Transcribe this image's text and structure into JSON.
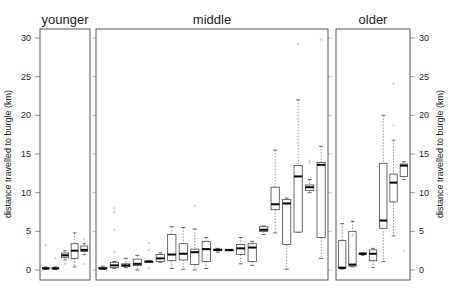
{
  "chart_data": {
    "type": "boxplot",
    "title": "",
    "ylabel": "distance travelled to burgle (km)",
    "ylim": [
      -1,
      31
    ],
    "yticks": [
      0,
      5,
      10,
      15,
      20,
      25,
      30
    ],
    "grid": false,
    "panels": [
      {
        "name": "younger",
        "boxes": [
          {
            "min": 0.1,
            "q1": 0.15,
            "median": 0.2,
            "q3": 0.3,
            "max": 0.4,
            "outliers": [
              3.2
            ]
          },
          {
            "min": 0.1,
            "q1": 0.15,
            "median": 0.2,
            "q3": 0.3,
            "max": 0.4,
            "outliers": [
              1.5
            ]
          },
          {
            "min": 1.3,
            "q1": 1.6,
            "median": 1.9,
            "q3": 2.2,
            "max": 2.5,
            "outliers": [
              0.8
            ]
          },
          {
            "min": 0.4,
            "q1": 1.5,
            "median": 2.5,
            "q3": 3.4,
            "max": 4.8,
            "outliers": []
          },
          {
            "min": 2.0,
            "q1": 2.4,
            "median": 2.6,
            "q3": 3.1,
            "max": 3.4,
            "outliers": [
              0.8,
              4.0
            ]
          }
        ]
      },
      {
        "name": "middle",
        "boxes": [
          {
            "min": 0.1,
            "q1": 0.15,
            "median": 0.2,
            "q3": 0.35,
            "max": 0.5,
            "outliers": []
          },
          {
            "min": 0.2,
            "q1": 0.3,
            "median": 0.6,
            "q3": 1.0,
            "max": 1.1,
            "outliers": [
              2.3,
              5.2,
              7.5,
              8.0
            ]
          },
          {
            "min": 0.3,
            "q1": 0.45,
            "median": 0.6,
            "q3": 0.8,
            "max": 1.5,
            "outliers": []
          },
          {
            "min": 0.0,
            "q1": 0.6,
            "median": 0.8,
            "q3": 1.4,
            "max": 1.9,
            "outliers": []
          },
          {
            "min": 1.0,
            "q1": 1.0,
            "median": 1.1,
            "q3": 1.1,
            "max": 1.2,
            "outliers": [
              0.2,
              2.6,
              3.5
            ]
          },
          {
            "min": 1.0,
            "q1": 1.1,
            "median": 1.5,
            "q3": 2.0,
            "max": 2.2,
            "outliers": []
          },
          {
            "min": 0.2,
            "q1": 1.2,
            "median": 2.0,
            "q3": 4.6,
            "max": 5.6,
            "outliers": []
          },
          {
            "min": 0.1,
            "q1": 1.3,
            "median": 2.1,
            "q3": 3.4,
            "max": 5.5,
            "outliers": []
          },
          {
            "min": 0.0,
            "q1": 0.7,
            "median": 2.3,
            "q3": 2.7,
            "max": 5.3,
            "outliers": [
              8.3
            ]
          },
          {
            "min": 0.2,
            "q1": 1.1,
            "median": 2.7,
            "q3": 3.7,
            "max": 4.2,
            "outliers": []
          },
          {
            "min": 2.3,
            "q1": 2.5,
            "median": 2.6,
            "q3": 2.7,
            "max": 2.8,
            "outliers": []
          },
          {
            "min": 2.6,
            "q1": 2.6,
            "median": 2.6,
            "q3": 2.6,
            "max": 2.6,
            "outliers": []
          },
          {
            "min": 0.8,
            "q1": 2.0,
            "median": 2.8,
            "q3": 3.3,
            "max": 4.2,
            "outliers": []
          },
          {
            "min": 0.6,
            "q1": 1.1,
            "median": 2.9,
            "q3": 3.4,
            "max": 3.7,
            "outliers": []
          },
          {
            "min": 4.6,
            "q1": 5.0,
            "median": 5.2,
            "q3": 5.6,
            "max": 5.7,
            "outliers": []
          },
          {
            "min": 4.8,
            "q1": 7.8,
            "median": 8.5,
            "q3": 10.7,
            "max": 15.5,
            "outliers": []
          },
          {
            "min": 0.1,
            "q1": 3.3,
            "median": 8.6,
            "q3": 9.1,
            "max": 9.3,
            "outliers": []
          },
          {
            "min": 4.9,
            "q1": 4.9,
            "median": 12.1,
            "q3": 13.5,
            "max": 22.0,
            "outliers": [
              29.2
            ]
          },
          {
            "min": 10.0,
            "q1": 10.3,
            "median": 10.7,
            "q3": 11.0,
            "max": 11.7,
            "outliers": [
              13.8,
              14.1
            ]
          },
          {
            "min": 1.5,
            "q1": 4.2,
            "median": 13.6,
            "q3": 13.9,
            "max": 16.0,
            "outliers": [
              29.8
            ]
          }
        ]
      },
      {
        "name": "older",
        "boxes": [
          {
            "min": 0.1,
            "q1": 0.2,
            "median": 0.3,
            "q3": 3.8,
            "max": 6.0,
            "outliers": []
          },
          {
            "min": 0.4,
            "q1": 0.5,
            "median": 0.7,
            "q3": 5.0,
            "max": 6.3,
            "outliers": [
              4.5
            ]
          },
          {
            "min": 1.9,
            "q1": 2.0,
            "median": 2.1,
            "q3": 2.2,
            "max": 2.2,
            "outliers": []
          },
          {
            "min": 0.3,
            "q1": 1.2,
            "median": 2.1,
            "q3": 2.6,
            "max": 2.8,
            "outliers": []
          },
          {
            "min": 1.1,
            "q1": 5.4,
            "median": 6.4,
            "q3": 13.8,
            "max": 20.0,
            "outliers": []
          },
          {
            "min": 4.4,
            "q1": 8.8,
            "median": 11.3,
            "q3": 12.4,
            "max": 16.8,
            "outliers": [
              18.7,
              24.1
            ]
          },
          {
            "min": 11.7,
            "q1": 12.1,
            "median": 13.5,
            "q3": 13.7,
            "max": 14.0,
            "outliers": [
              2.5
            ]
          }
        ]
      }
    ]
  },
  "labels": {
    "panel_younger": "younger",
    "panel_middle": "middle",
    "panel_older": "older",
    "ylabel_left": "distance travelled to burgle (km)",
    "ylabel_right": "distance travelled to burgle (km)"
  }
}
